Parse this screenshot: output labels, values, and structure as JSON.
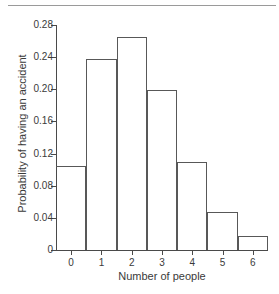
{
  "chart_data": {
    "type": "bar",
    "title": "",
    "subtitle": "",
    "xlabel": "Number of people",
    "ylabel": "Probability of having an accident",
    "categories": [
      "0",
      "1",
      "2",
      "3",
      "4",
      "5",
      "6"
    ],
    "values": [
      0.105,
      0.238,
      0.265,
      0.199,
      0.11,
      0.047,
      0.018
    ],
    "series": [
      {
        "name": "Probability of having an accident",
        "values": [
          0.105,
          0.238,
          0.265,
          0.199,
          0.11,
          0.047,
          0.018
        ]
      }
    ],
    "xlim": [
      -0.5,
      6.5
    ],
    "ylim": [
      0,
      0.28
    ],
    "ytick_labels": [
      "0",
      "0.04",
      "0.08",
      "0.12",
      "0.16",
      "0.20",
      "0.24",
      "0.28"
    ],
    "ytick_values": [
      0,
      0.04,
      0.08,
      0.12,
      0.16,
      0.2,
      0.24,
      0.28
    ],
    "xtick_labels": [
      "0",
      "1",
      "2",
      "3",
      "4",
      "5",
      "6"
    ],
    "xtick_values": [
      0,
      1,
      2,
      3,
      4,
      5,
      6
    ],
    "grid": false,
    "legend": false,
    "legend_position": "none",
    "bar_style": "outline",
    "bar_width": 1,
    "annotations": []
  },
  "style": {
    "background": "#ffffff",
    "line_color": "#585858",
    "axis_color": "#4a4a4a",
    "text_color": "#3a3a3a",
    "rule_color": "#9a9a9a"
  }
}
